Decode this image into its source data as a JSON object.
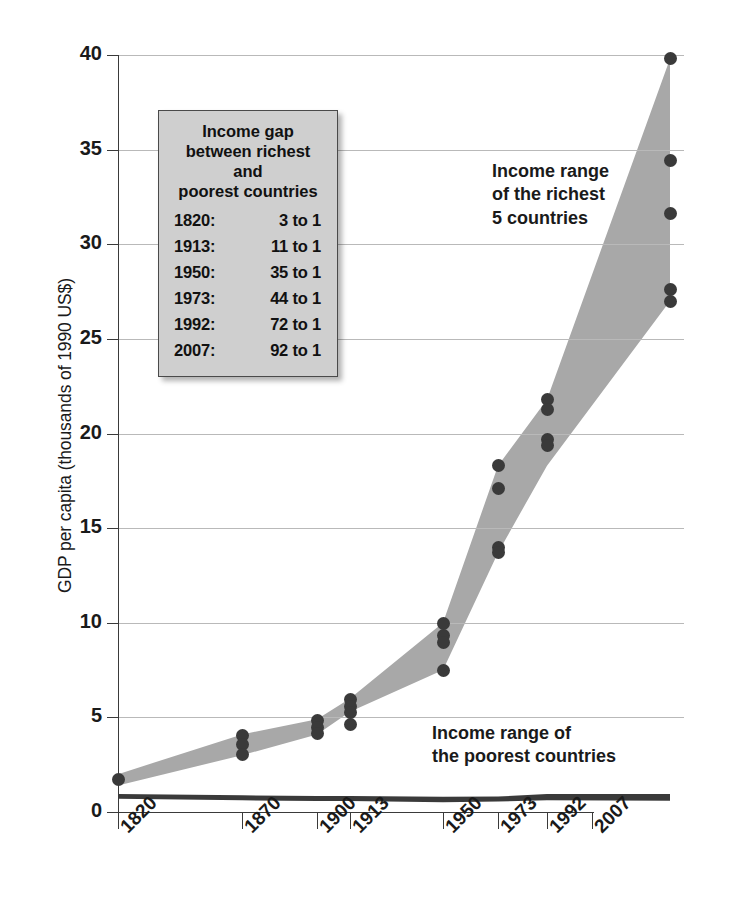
{
  "chart_data": {
    "type": "area",
    "title": "",
    "subtitle": "",
    "xlabel": "",
    "ylabel": "GDP per capita (thousands of 1990 US$)",
    "categories": [
      "1820",
      "1870",
      "1900",
      "1913",
      "1950",
      "1973",
      "1992",
      "2007"
    ],
    "x_positions_year": [
      1820,
      1870,
      1900,
      1913,
      1950,
      1973,
      1992,
      2007
    ],
    "ylim": [
      0,
      40
    ],
    "yticks": [
      "0",
      "5",
      "10",
      "15",
      "20",
      "25",
      "30",
      "35",
      "40"
    ],
    "ytick_values": [
      0,
      5,
      10,
      15,
      20,
      25,
      30,
      35,
      40
    ],
    "grid": "horizontal",
    "legend_position": "inside-upper-left",
    "series": [
      {
        "name": "Income range of the richest 5 countries",
        "color": "#a8a8a8",
        "upper": [
          2.0,
          4.1,
          4.9,
          6.0,
          10.0,
          18.3,
          21.8,
          39.8
        ],
        "lower": [
          1.4,
          3.0,
          4.1,
          5.3,
          7.5,
          13.7,
          18.3,
          27.0
        ]
      },
      {
        "name": "Income range of the poorest countries",
        "color": "#3a3a3a",
        "upper": [
          0.95,
          0.88,
          0.85,
          0.85,
          0.8,
          0.82,
          0.95,
          0.95
        ],
        "lower": [
          0.7,
          0.62,
          0.58,
          0.58,
          0.52,
          0.55,
          0.62,
          0.6
        ]
      }
    ],
    "points": [
      {
        "year": "1820",
        "values": [
          1.7
        ]
      },
      {
        "year": "1870",
        "values": [
          4.05,
          3.55,
          3.05
        ]
      },
      {
        "year": "1900",
        "values": [
          4.85,
          4.45,
          4.15
        ]
      },
      {
        "year": "1913",
        "values": [
          5.95,
          5.55,
          5.25,
          4.6
        ]
      },
      {
        "year": "1950",
        "values": [
          9.95,
          9.35,
          8.95,
          7.5
        ]
      },
      {
        "year": "1973",
        "values": [
          18.3,
          17.1,
          13.95,
          13.7
        ]
      },
      {
        "year": "1992",
        "values": [
          21.8,
          21.25,
          19.7,
          19.35
        ]
      },
      {
        "year": "2007",
        "values": [
          39.8,
          34.4,
          31.6,
          27.6,
          27.0
        ]
      }
    ],
    "annotations": [
      {
        "text": "Income range of the richest 5 countries",
        "position": "upper-right"
      },
      {
        "text": "Income range of the poorest countries",
        "position": "lower-right"
      }
    ]
  },
  "axes": {
    "y_title": "GDP per capita (thousands of 1990 US$)",
    "y_ticks": [
      "40",
      "35",
      "30",
      "25",
      "20",
      "15",
      "10",
      "5",
      "0"
    ],
    "x_ticks": [
      "1820",
      "1870",
      "1900",
      "1913",
      "1950",
      "1973",
      "1992",
      "2007"
    ]
  },
  "legend": {
    "title_line1": "Income gap",
    "title_line2": "between richest and",
    "title_line3": "poorest countries",
    "rows": [
      {
        "year": "1820:",
        "ratio": "3 to 1"
      },
      {
        "year": "1913:",
        "ratio": "11 to 1"
      },
      {
        "year": "1950:",
        "ratio": "35 to 1"
      },
      {
        "year": "1973:",
        "ratio": "44 to 1"
      },
      {
        "year": "1992:",
        "ratio": "72 to 1"
      },
      {
        "year": "2007:",
        "ratio": "92 to 1"
      }
    ]
  },
  "annotations": {
    "rich_line1": "Income range",
    "rich_line2": "of the richest",
    "rich_line3": "5 countries",
    "poor_line1": "Income range of",
    "poor_line2": "the poorest countries"
  },
  "colors": {
    "rich_band": "#a8a8a8",
    "poor_band": "#3a3a3a",
    "dot": "#3a3a3a",
    "grid": "#b9b9b9",
    "axis": "#3a3a3a",
    "legend_bg": "#cfcfcf",
    "legend_border": "#4a4a4a",
    "text": "#1a1a1a",
    "background": "#ffffff"
  }
}
